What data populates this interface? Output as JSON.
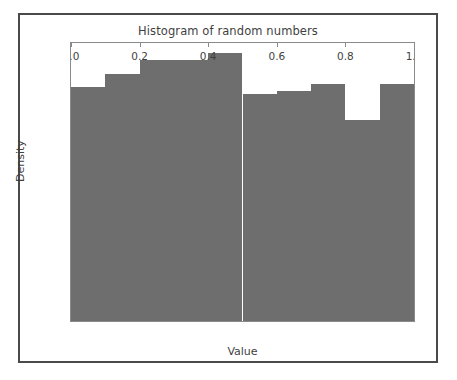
{
  "chart_data": {
    "type": "bar",
    "title": "Histogram of random numbers",
    "xlabel": "Value",
    "ylabel": "Density",
    "grid": false,
    "legend": null,
    "xlim": [
      0.0,
      1.0
    ],
    "ylim": [
      0,
      115
    ],
    "xticks": [
      "0.0",
      "0.2",
      "0.4",
      "0.6",
      "0.8",
      "1.0"
    ],
    "xtick_values": [
      0.0,
      0.2,
      0.4,
      0.6,
      0.8,
      1.0
    ],
    "yticks": [
      "0",
      "20",
      "40",
      "60",
      "80",
      "100"
    ],
    "ytick_values": [
      0,
      20,
      40,
      60,
      80,
      100
    ],
    "bin_edges": [
      0.0,
      0.1,
      0.2,
      0.3,
      0.4,
      0.5,
      0.6,
      0.7,
      0.8,
      0.9,
      1.0
    ],
    "categories": [
      "0.0-0.1",
      "0.1-0.2",
      "0.2-0.3",
      "0.3-0.4",
      "0.4-0.5",
      "0.5-0.6",
      "0.6-0.7",
      "0.7-0.8",
      "0.8-0.9",
      "0.9-1.0"
    ],
    "values": [
      97,
      102,
      108,
      108,
      111,
      94,
      95,
      98,
      83,
      98
    ],
    "bar_color": "#6e6e6e",
    "axes_color": "#8a8a8a",
    "text_color": "#3f3f3f",
    "frame_color": "#4a4a4a",
    "background_color": "#ffffff"
  }
}
